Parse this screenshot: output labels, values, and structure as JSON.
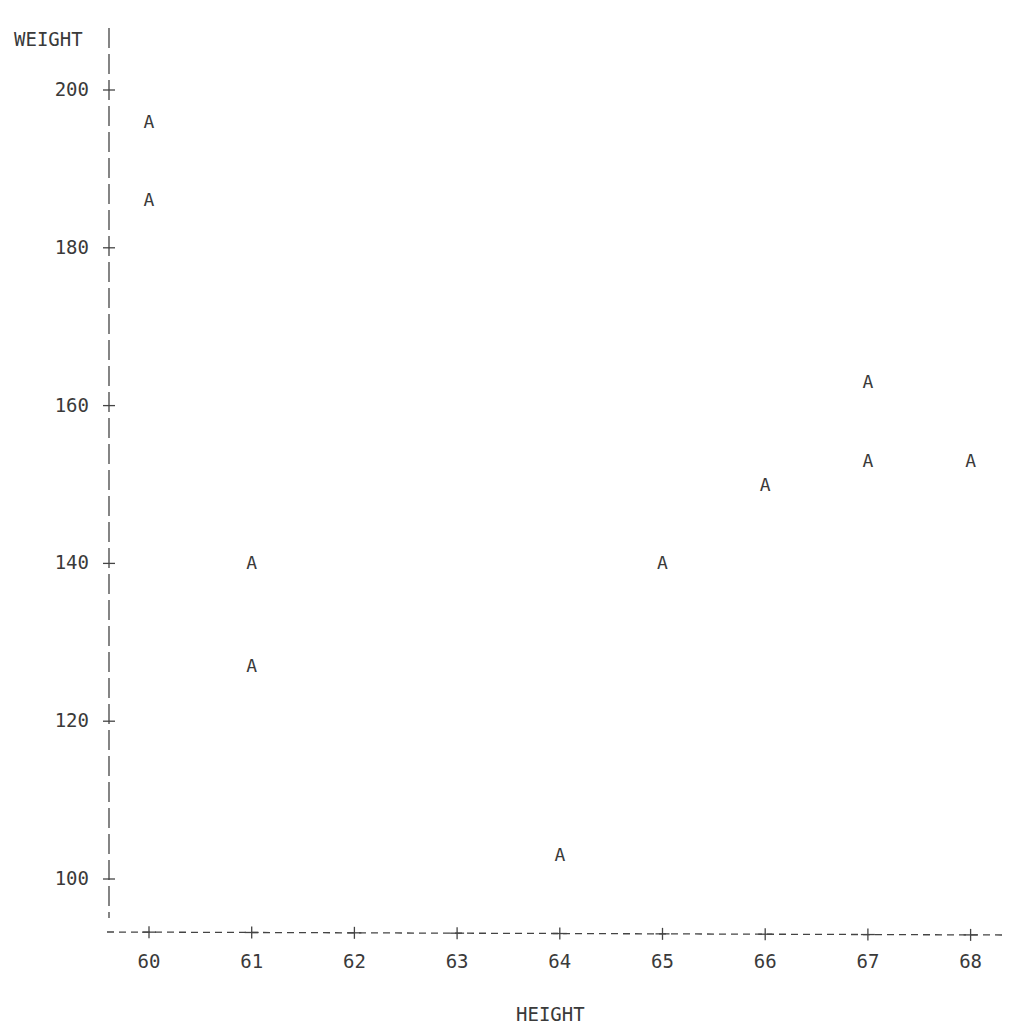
{
  "chart_data": {
    "type": "scatter",
    "title": "",
    "xlabel": "HEIGHT",
    "ylabel": "WEIGHT",
    "symbol": "A",
    "xlim": [
      60,
      68
    ],
    "ylim": [
      100,
      200
    ],
    "x_ticks": [
      "60",
      "61",
      "62",
      "63",
      "64",
      "65",
      "66",
      "67",
      "68"
    ],
    "y_ticks": [
      "200",
      "180",
      "160",
      "140",
      "120",
      "100"
    ],
    "grid": false,
    "legend": null,
    "points": [
      {
        "x": 60,
        "y": 196
      },
      {
        "x": 60,
        "y": 186
      },
      {
        "x": 61,
        "y": 140
      },
      {
        "x": 61,
        "y": 127
      },
      {
        "x": 64,
        "y": 103
      },
      {
        "x": 65,
        "y": 140
      },
      {
        "x": 66,
        "y": 150
      },
      {
        "x": 67,
        "y": 163
      },
      {
        "x": 67,
        "y": 153
      },
      {
        "x": 68,
        "y": 153
      }
    ]
  },
  "axes": {
    "y_title": "WEIGHT",
    "x_title": "HEIGHT",
    "y_ticks": [
      "200",
      "180",
      "160",
      "140",
      "120",
      "100"
    ],
    "x_ticks": [
      "60",
      "61",
      "62",
      "63",
      "64",
      "65",
      "66",
      "67",
      "68"
    ]
  },
  "marker": "A"
}
